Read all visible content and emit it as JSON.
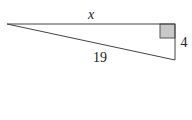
{
  "diagram": {
    "type": "right-triangle",
    "labels": {
      "top_leg": "x",
      "right_leg": "4",
      "hypotenuse": "19"
    },
    "vertices": {
      "left": [
        7,
        24
      ],
      "top_right": [
        175,
        24
      ],
      "bottom_right": [
        175,
        60
      ]
    },
    "right_angle_marker": {
      "position": "top_right",
      "fill": "#c8c8c8"
    },
    "colors": {
      "line": "#444444",
      "marker_fill": "#c8c8c8",
      "text": "#222222"
    }
  }
}
